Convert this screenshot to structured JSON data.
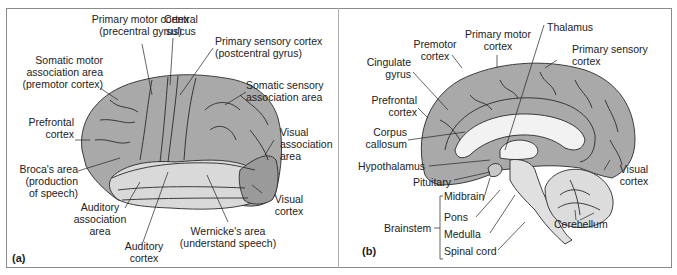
{
  "figure": {
    "panels": [
      {
        "tag": "(a)",
        "view": "lateral",
        "labels": {
          "primary_motor": "Primary motor cortex\n(precentral gyrus)",
          "central_sulcus": "Central\nsulcus",
          "primary_sensory": "Primary sensory cortex\n(postcentral gyrus)",
          "somatic_motor_assoc": "Somatic motor\nassociation area\n(premotor cortex)",
          "somatic_sensory_assoc": "Somatic sensory\nassociation area",
          "prefrontal": "Prefrontal\ncortex",
          "visual_assoc": "Visual\nassociation\narea",
          "broca": "Broca's area\n(production\nof speech)",
          "visual_cortex": "Visual\ncortex",
          "auditory_assoc": "Auditory\nassociation\narea",
          "wernicke": "Wernicke's area\n(understand speech)",
          "auditory_cortex": "Auditory\ncortex"
        }
      },
      {
        "tag": "(b)",
        "view": "midsagittal",
        "labels": {
          "primary_motor": "Primary motor\ncortex",
          "thalamus": "Thalamus",
          "premotor": "Premotor\ncortex",
          "primary_sensory": "Primary sensory\ncortex",
          "cingulate": "Cingulate\ngyrus",
          "prefrontal": "Prefrontal\ncortex",
          "corpus_callosum": "Corpus\ncallosum",
          "hypothalamus": "Hypothalamus",
          "visual_cortex": "Visual\ncortex",
          "pituitary": "Pituitary",
          "brainstem": "Brainstem",
          "midbrain": "Midbrain",
          "pons": "Pons",
          "medulla": "Medulla",
          "spinal_cord": "Spinal cord",
          "cerebellum": "Cerebellum"
        }
      }
    ],
    "colors": {
      "cortex_dark": "#a9a9a9",
      "temporal_light": "#d9d9d9",
      "white_matter": "#f2f2f2",
      "outline": "#2a2a2a",
      "frame": "#8a8a8a"
    }
  }
}
